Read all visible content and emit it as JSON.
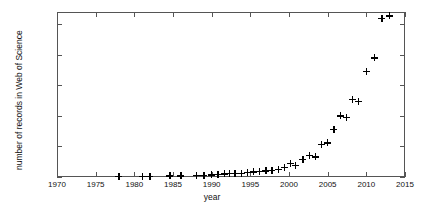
{
  "chart_data": {
    "type": "scatter",
    "title": "",
    "xlabel": "year",
    "ylabel": "number of records in Web of Science",
    "xlim": [
      1970,
      2015
    ],
    "ylim": [
      0,
      540
    ],
    "xticks": [
      1970,
      1975,
      1980,
      1985,
      1990,
      1995,
      2000,
      2005,
      2010,
      2015
    ],
    "xticklabels": [
      "1970",
      "1975",
      "1980",
      "1985",
      "1990",
      "1995",
      "2000",
      "2005",
      "2010",
      "2015"
    ],
    "yticks": [
      0,
      100,
      200,
      300,
      400,
      500
    ],
    "yticklabels": [
      "0",
      "100",
      "200",
      "300",
      "400",
      "500"
    ],
    "grid": false,
    "legend": null,
    "marker": "plus",
    "marker_color": "#000000",
    "x": [
      1978,
      1981,
      1982,
      1984,
      1985,
      1986,
      1988,
      1989,
      1990,
      1991,
      1992,
      1993,
      1994,
      1995,
      1996,
      1997,
      1998,
      1999,
      2000,
      2001,
      2002,
      2003,
      2004,
      2005,
      2006,
      2007,
      2008,
      2009,
      2010,
      2011,
      2012,
      2013
    ],
    "y": [
      2,
      2,
      2,
      3,
      3,
      3,
      4,
      4,
      5,
      5,
      6,
      7,
      8,
      9,
      11,
      12,
      14,
      18,
      32,
      25,
      40,
      55,
      56,
      88,
      112,
      140,
      155,
      190,
      215,
      256,
      247,
      330,
      380,
      390,
      520,
      525
    ],
    "values": [
      {
        "year": 1978,
        "records": 2
      },
      {
        "year": 1981,
        "records": 2
      },
      {
        "year": 1982,
        "records": 2
      },
      {
        "year": 1984,
        "records": 3
      },
      {
        "year": 1985,
        "records": 3
      },
      {
        "year": 1986,
        "records": 3
      },
      {
        "year": 1988,
        "records": 4
      },
      {
        "year": 1989,
        "records": 4
      },
      {
        "year": 1990,
        "records": 5
      },
      {
        "year": 1991,
        "records": 6
      },
      {
        "year": 1992,
        "records": 7
      },
      {
        "year": 1993,
        "records": 8
      },
      {
        "year": 1994,
        "records": 9
      },
      {
        "year": 1995,
        "records": 11
      },
      {
        "year": 1996,
        "records": 14
      },
      {
        "year": 1997,
        "records": 16
      },
      {
        "year": 1998,
        "records": 20
      },
      {
        "year": 1999,
        "records": 28
      },
      {
        "year": 2000,
        "records": 48
      },
      {
        "year": 2001,
        "records": 40
      },
      {
        "year": 2002,
        "records": 64
      },
      {
        "year": 2003,
        "records": 90
      },
      {
        "year": 2004,
        "records": 92
      },
      {
        "year": 2005,
        "records": 140
      },
      {
        "year": 2006,
        "records": 180
      },
      {
        "year": 2007,
        "records": 176
      },
      {
        "year": 2008,
        "records": 196
      },
      {
        "year": 2009,
        "records": 238
      },
      {
        "year": 2010,
        "records": 288
      },
      {
        "year": 2011,
        "records": 278
      },
      {
        "year": 2012,
        "records": 520
      },
      {
        "year": 2013,
        "records": 527
      }
    ],
    "points": [
      {
        "year": 1978,
        "records": 2
      },
      {
        "year": 1981,
        "records": 3
      },
      {
        "year": 1982,
        "records": 3
      },
      {
        "year": 1984.6,
        "records": 4
      },
      {
        "year": 1986,
        "records": 4
      },
      {
        "year": 1988,
        "records": 5
      },
      {
        "year": 1989,
        "records": 6
      },
      {
        "year": 1990,
        "records": 7
      },
      {
        "year": 1990.8,
        "records": 9
      },
      {
        "year": 1991.6,
        "records": 10
      },
      {
        "year": 1992.3,
        "records": 11
      },
      {
        "year": 1993,
        "records": 12
      },
      {
        "year": 1993.8,
        "records": 13
      },
      {
        "year": 1994.6,
        "records": 15
      },
      {
        "year": 1995.4,
        "records": 17
      },
      {
        "year": 1996.2,
        "records": 18
      },
      {
        "year": 1997,
        "records": 20
      },
      {
        "year": 1997.8,
        "records": 22
      },
      {
        "year": 1998.6,
        "records": 26
      },
      {
        "year": 1999.4,
        "records": 32
      },
      {
        "year": 2000.2,
        "records": 45
      },
      {
        "year": 2000.8,
        "records": 38
      },
      {
        "year": 2001.8,
        "records": 58
      },
      {
        "year": 2002.6,
        "records": 72
      },
      {
        "year": 2003.4,
        "records": 66
      },
      {
        "year": 2004.2,
        "records": 108
      },
      {
        "year": 2005,
        "records": 112
      },
      {
        "year": 2005.8,
        "records": 155
      },
      {
        "year": 2006.6,
        "records": 200
      },
      {
        "year": 2007.4,
        "records": 195
      },
      {
        "year": 2008.2,
        "records": 255
      },
      {
        "year": 2009,
        "records": 248
      },
      {
        "year": 2010,
        "records": 345
      },
      {
        "year": 2011,
        "records": 390
      },
      {
        "year": 2012,
        "records": 520
      },
      {
        "year": 2013,
        "records": 527
      }
    ]
  }
}
